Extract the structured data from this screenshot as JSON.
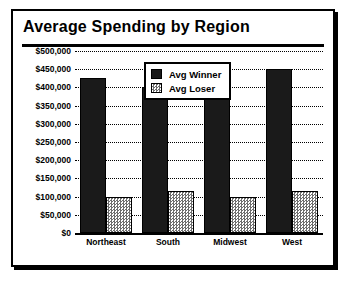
{
  "card": {
    "title": "Average Spending by Region"
  },
  "legend": {
    "position": "top-center",
    "entries": [
      {
        "label": "Avg Winner",
        "swatch": "solid-black-swatch"
      },
      {
        "label": "Avg Loser",
        "swatch": "stippled-gray-swatch"
      }
    ]
  },
  "chart_data": {
    "type": "bar",
    "title": "Average Spending by Region",
    "xlabel": "",
    "ylabel": "",
    "categories": [
      "Northeast",
      "South",
      "Midwest",
      "West"
    ],
    "series": [
      {
        "name": "Avg Winner",
        "values": [
          425000,
          400000,
          375000,
          450000
        ]
      },
      {
        "name": "Avg Loser",
        "values": [
          100000,
          115000,
          100000,
          115000
        ]
      }
    ],
    "ylim": [
      0,
      500000
    ],
    "ytick_values": [
      0,
      50000,
      100000,
      150000,
      200000,
      250000,
      300000,
      350000,
      400000,
      450000,
      500000
    ],
    "ytick_labels": [
      "$0",
      "$50,000",
      "$100,000",
      "$150,000",
      "$200,000",
      "$250,000",
      "$300,000",
      "$350,000",
      "$400,000",
      "$450,000",
      "$500,000"
    ],
    "grid": true,
    "grid_style": "dotted-horizontal",
    "legend_position": "top-center",
    "colors": {
      "winner": "#1a1a1a",
      "loser": "#c9c9c9",
      "frame": "#000000",
      "background": "#ffffff"
    }
  }
}
